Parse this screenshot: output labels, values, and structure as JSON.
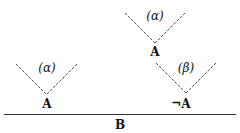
{
  "diagram": {
    "baseline_label": "B",
    "cones": [
      {
        "id": "left",
        "label": "(α)",
        "node": "A"
      },
      {
        "id": "top",
        "label": "(α)",
        "node": "A"
      },
      {
        "id": "right",
        "label": "(β)",
        "node": "¬A"
      }
    ]
  },
  "colors": {
    "line": "#555555",
    "text": "#111111",
    "background": "#ffffff"
  }
}
